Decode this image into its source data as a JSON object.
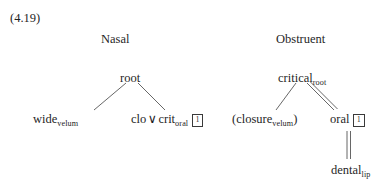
{
  "figure": {
    "example_number": "(4.19)",
    "type": "phonological-feature-geometry-trees",
    "font_color": "#1f1f1f",
    "background": "#ffffff",
    "line_color": "#4a4a4a"
  },
  "trees": [
    {
      "id": "nasal",
      "header": "Nasal",
      "root": {
        "label": "root",
        "subscript": "",
        "index_box": ""
      },
      "children": [
        {
          "id": "wide-velum",
          "label": "wide",
          "subscript": "velum",
          "index_box": "",
          "paren_open": "",
          "paren_close": "",
          "branch": "single"
        },
        {
          "id": "clo-or-crit-oral",
          "label_first": "clo",
          "operator": "∨",
          "label_second": "crit",
          "subscript": "oral",
          "index_box": "1",
          "branch": "single"
        }
      ]
    },
    {
      "id": "obstruent",
      "header": "Obstruent",
      "root": {
        "label": "critical",
        "subscript": "root",
        "index_box": ""
      },
      "children": [
        {
          "id": "closure-velum",
          "paren_open": "(",
          "label": "closure",
          "subscript": "velum",
          "paren_close": ")",
          "index_box": "",
          "branch": "single"
        },
        {
          "id": "oral",
          "label": "oral",
          "subscript": "",
          "index_box": "1",
          "branch": "double",
          "child": {
            "id": "dental-lip",
            "label": "dental",
            "subscript": "lip",
            "index_box": "",
            "branch": "double-vertical"
          }
        }
      ]
    }
  ]
}
